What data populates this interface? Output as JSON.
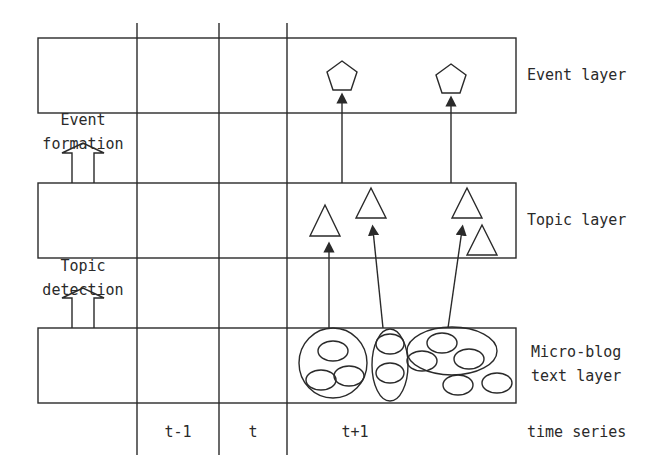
{
  "diagram": {
    "layers": [
      {
        "id": "event",
        "label": "Event layer"
      },
      {
        "id": "topic",
        "label": "Topic layer"
      },
      {
        "id": "microblog",
        "label_line1": "Micro-blog",
        "label_line2": "text layer"
      }
    ],
    "processes": [
      {
        "id": "event-formation",
        "line1": "Event",
        "line2": "formation"
      },
      {
        "id": "topic-detection",
        "line1": "Topic",
        "line2": "detection"
      }
    ],
    "time_axis": {
      "label": "time series",
      "columns": [
        "t-1",
        "t",
        "t+1"
      ]
    },
    "shapes": {
      "event_nodes": "pentagon",
      "topic_nodes": "triangle",
      "text_nodes": "ellipse",
      "pentagon_count": 2,
      "triangle_count": 4,
      "cluster_count": 3,
      "ellipse_count": 10
    },
    "colors": {
      "stroke": "#2a2a2a",
      "background": "#ffffff"
    }
  }
}
